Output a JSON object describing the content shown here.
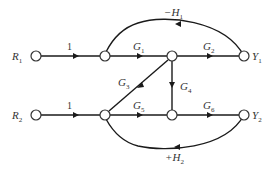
{
  "diagram": {
    "type": "signal-flow-graph",
    "inputs": [
      {
        "id": "R1",
        "label": "R",
        "sub": "1"
      },
      {
        "id": "R2",
        "label": "R",
        "sub": "2"
      }
    ],
    "outputs": [
      {
        "id": "Y1",
        "label": "Y",
        "sub": "1"
      },
      {
        "id": "Y2",
        "label": "Y",
        "sub": "2"
      }
    ],
    "branches": [
      {
        "from": "R1",
        "to": "A",
        "gain": "1"
      },
      {
        "from": "A",
        "to": "B",
        "gain": "G",
        "sub": "1"
      },
      {
        "from": "B",
        "to": "Y1",
        "gain": "G",
        "sub": "2"
      },
      {
        "from": "C",
        "to": "B",
        "gain": "G",
        "sub": "3"
      },
      {
        "from": "B",
        "to": "D",
        "gain": "G",
        "sub": "4"
      },
      {
        "from": "C",
        "to": "D",
        "gain": "G",
        "sub": "5"
      },
      {
        "from": "D",
        "to": "Y2",
        "gain": "G",
        "sub": "6"
      },
      {
        "from": "R2",
        "to": "C",
        "gain": "1"
      },
      {
        "from": "Y1",
        "to": "A",
        "gain": "−H",
        "sub": "1"
      },
      {
        "from": "Y2",
        "to": "C",
        "gain": "+H",
        "sub": "2"
      }
    ]
  }
}
